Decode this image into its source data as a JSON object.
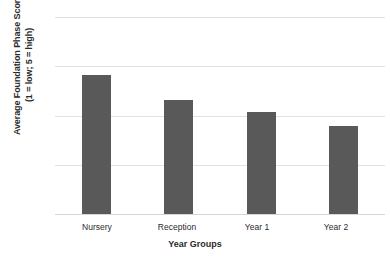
{
  "chart_data": {
    "type": "bar",
    "title": "",
    "categories": [
      "Nursery",
      "Reception",
      "Year 1",
      "Year 2"
    ],
    "values": [
      3.83,
      3.32,
      3.08,
      2.79
    ],
    "xlabel": "Year Groups",
    "ylabel": "Average Foundation Phase Score (1 = low; 5 = high)",
    "ylabel_line1": "Average Foundation Phase Score",
    "ylabel_line2": "(1 = low; 5 = high)",
    "ylim": [
      1,
      5
    ],
    "yticks": [
      1,
      2,
      3,
      4,
      5
    ],
    "ytick_labels": [
      "1",
      "2",
      "3",
      "4",
      "5"
    ],
    "grid": true,
    "legend": false,
    "bar_color": "#595959",
    "gridline_color": "#E2E2E2",
    "background_color": "#FFFFFF"
  }
}
